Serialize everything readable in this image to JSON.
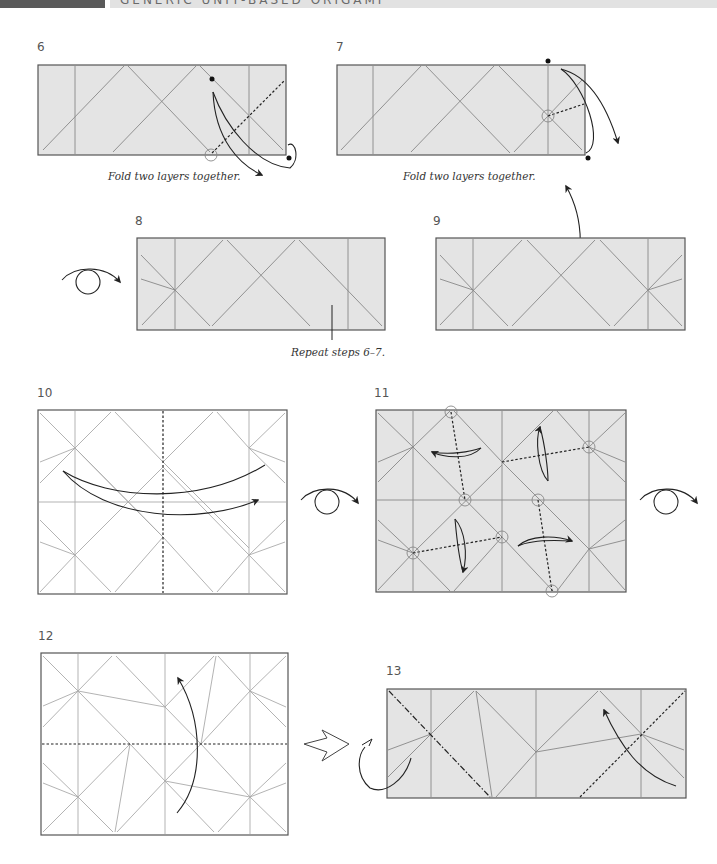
{
  "header": {
    "title": "GENERIC UNIT-BASED ORIGAMI",
    "accent_dark": "#5a5a5a",
    "accent_light": "#e2e2e2"
  },
  "steps": [
    {
      "number": "6",
      "caption": "Fold two layers together.",
      "paper": "shaded"
    },
    {
      "number": "7",
      "caption": "Fold two layers together.",
      "paper": "shaded"
    },
    {
      "number": "8",
      "caption": "Repeat steps 6–7.",
      "paper": "shaded",
      "symbol": "turn-over"
    },
    {
      "number": "9",
      "caption": "",
      "paper": "shaded"
    },
    {
      "number": "10",
      "caption": "",
      "paper": "white",
      "symbol": "turn-over"
    },
    {
      "number": "11",
      "caption": "",
      "paper": "shaded",
      "symbol": "turn-over"
    },
    {
      "number": "12",
      "caption": "",
      "paper": "white",
      "symbol": "hollow-arrow"
    },
    {
      "number": "13",
      "caption": "",
      "paper": "shaded"
    }
  ],
  "colors": {
    "paper_shaded": "#e4e4e4",
    "paper_white": "#ffffff",
    "crease": "#8a8a8a",
    "outline": "#555555",
    "arrow": "#222222"
  },
  "icons": {
    "turn_over": "turn-over-icon",
    "valley_fold": "valley-fold-dashed-line",
    "mountain_fold": "mountain-fold-dash-dot-line",
    "pivot_circle": "pivot-circle-icon",
    "reference_dot": "reference-dot-icon",
    "push_arrow": "hollow-push-arrow-icon"
  }
}
